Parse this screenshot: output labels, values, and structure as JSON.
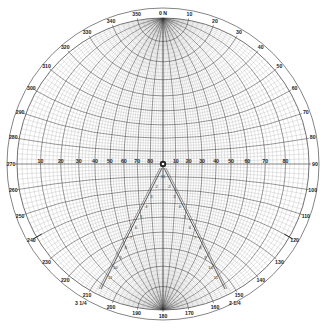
{
  "diagram": {
    "type": "stereographic-net",
    "center": [
      163,
      164
    ],
    "net_radius": 146,
    "outer_ring_radius": 156,
    "colors": {
      "line": "#333333",
      "minor": "#9a9a9a",
      "background": "#ffffff"
    },
    "top_marker": "0 N",
    "azimuth_labels": [
      "350",
      "10",
      "20",
      "30",
      "40",
      "50",
      "60",
      "70",
      "80",
      "90",
      "100",
      "110",
      "120",
      "130",
      "140",
      "150",
      "160",
      "170",
      "180",
      "190",
      "200",
      "210",
      "220",
      "230",
      "240",
      "250",
      "260",
      "270",
      "280",
      "290",
      "300",
      "310",
      "320",
      "330",
      "340"
    ],
    "azimuth_values": [
      350,
      10,
      20,
      30,
      40,
      50,
      60,
      70,
      80,
      90,
      100,
      110,
      120,
      130,
      140,
      150,
      160,
      170,
      180,
      190,
      200,
      210,
      220,
      230,
      240,
      250,
      260,
      270,
      280,
      290,
      300,
      310,
      320,
      330,
      340
    ],
    "horizontal_scale_left": [
      "10",
      "20",
      "30",
      "40",
      "50",
      "60",
      "70",
      "80"
    ],
    "horizontal_scale_right": [
      "10",
      "20",
      "30",
      "40",
      "50",
      "60",
      "70",
      "80"
    ],
    "diagonal_markers": {
      "left": "3 1/4",
      "right": "2 1/4",
      "left_arrow_az": 240,
      "right_arrow_az": 120
    },
    "major_interval_deg": 10,
    "minor_interval_deg": 2
  }
}
